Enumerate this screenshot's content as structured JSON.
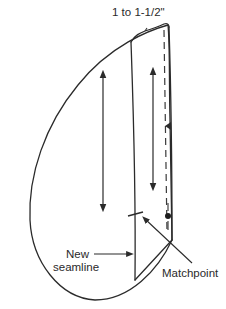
{
  "diagram": {
    "type": "sewing-pattern-piece",
    "labels": {
      "top_measurement": "1 to 1-1/2\"",
      "new_seamline_line1": "New",
      "new_seamline_line2": "seamline",
      "matchpoint": "Matchpoint"
    },
    "elements": [
      "pattern-outline",
      "new-seamline",
      "dashed-fold-line",
      "grainline-arrow-left",
      "grainline-arrow-middle",
      "notch",
      "matchpoint-dot",
      "seamline-tick"
    ],
    "colors": {
      "line": "#2b2b2b",
      "background": "#ffffff"
    }
  }
}
